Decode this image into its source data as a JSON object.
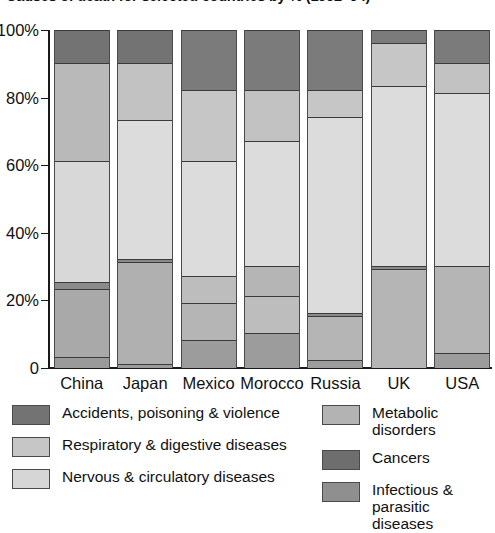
{
  "title": "Causes of death for selected countries by % (1992–94)",
  "axis": {
    "y_ticks": [
      "100%",
      "80%",
      "60%",
      "40%",
      "20%",
      "0"
    ],
    "y_tick_values": [
      100,
      80,
      60,
      40,
      20,
      0
    ]
  },
  "legend": {
    "left": [
      {
        "label": "Accidents, poisoning & violence",
        "color": "#737373"
      },
      {
        "label": "Respiratory & digestive diseases",
        "color": "#c6c6c6"
      },
      {
        "label": "Nervous & circulatory diseases",
        "color": "#d6d6d6"
      }
    ],
    "right": [
      {
        "label": "Metabolic disorders",
        "color": "#b3b3b3"
      },
      {
        "label": "Cancers",
        "color": "#6e6e6e"
      },
      {
        "label": "Infectious & parasitic diseases",
        "color": "#8f8f8f"
      }
    ]
  },
  "chart_data": {
    "type": "bar",
    "subtype": "stacked-100-percent",
    "title": "Causes of death for selected countries by % (1992–94)",
    "xlabel": "",
    "ylabel": "",
    "ylim": [
      0,
      100
    ],
    "grid": false,
    "legend_position": "bottom",
    "categories": [
      "China",
      "Japan",
      "Mexico",
      "Morocco",
      "Russia",
      "UK",
      "USA"
    ],
    "series": [
      {
        "name": "Accidents, poisoning & violence",
        "color": "#737373",
        "values": [
          10,
          10,
          18,
          18,
          18,
          4,
          10
        ]
      },
      {
        "name": "Metabolic disorders",
        "color": "#b3b3b3",
        "values": [
          29,
          17,
          0,
          15,
          8,
          13,
          9
        ]
      },
      {
        "name": "Respiratory & digestive diseases",
        "color": "#c6c6c6",
        "values": [
          0,
          0,
          21,
          0,
          0,
          0,
          0
        ]
      },
      {
        "name": "Nervous & circulatory diseases",
        "color": "#d6d6d6",
        "values": [
          36,
          41,
          34,
          37,
          58,
          53,
          51
        ]
      },
      {
        "name": "Cancers",
        "color": "#6e6e6e",
        "values": [
          2,
          1,
          0,
          0,
          1,
          0,
          0
        ]
      },
      {
        "name": "Infectious & parasitic diseases",
        "color": "#8f8f8f",
        "values": [
          20,
          30,
          19,
          20,
          14,
          30,
          26
        ]
      },
      {
        "name": "Other (lower band)",
        "color": "#8f8f8f",
        "values": [
          3,
          1,
          8,
          10,
          1,
          0,
          4
        ]
      }
    ],
    "bars": [
      {
        "category": "China",
        "segments": [
          {
            "label": "Accidents, poisoning & violence",
            "value": 10,
            "from": 90,
            "to": 100,
            "color": "#737373"
          },
          {
            "label": "Metabolic disorders",
            "value": 29,
            "from": 61,
            "to": 90,
            "color": "#b9b9b9"
          },
          {
            "label": "Nervous & circulatory diseases",
            "value": 36,
            "from": 25,
            "to": 61,
            "color": "#d8d8d8"
          },
          {
            "label": "Cancers",
            "value": 2,
            "from": 23,
            "to": 25,
            "color": "#8a8a8a"
          },
          {
            "label": "Infectious & parasitic diseases",
            "value": 20,
            "from": 3,
            "to": 23,
            "color": "#a9a9a9"
          },
          {
            "label": "Other",
            "value": 3,
            "from": 0,
            "to": 3,
            "color": "#9a9a9a"
          }
        ]
      },
      {
        "category": "Japan",
        "segments": [
          {
            "label": "Accidents, poisoning & violence",
            "value": 10,
            "from": 90,
            "to": 100,
            "color": "#737373"
          },
          {
            "label": "Metabolic disorders",
            "value": 17,
            "from": 73,
            "to": 90,
            "color": "#c2c2c2"
          },
          {
            "label": "Nervous & circulatory diseases",
            "value": 41,
            "from": 32,
            "to": 73,
            "color": "#dcdcdc"
          },
          {
            "label": "Cancers",
            "value": 1,
            "from": 31,
            "to": 32,
            "color": "#8a8a8a"
          },
          {
            "label": "Infectious & parasitic diseases",
            "value": 30,
            "from": 1,
            "to": 31,
            "color": "#b0b0b0"
          },
          {
            "label": "Other",
            "value": 1,
            "from": 0,
            "to": 1,
            "color": "#9a9a9a"
          }
        ]
      },
      {
        "category": "Mexico",
        "segments": [
          {
            "label": "Accidents, poisoning & violence",
            "value": 18,
            "from": 82,
            "to": 100,
            "color": "#7b7b7b"
          },
          {
            "label": "Respiratory & digestive diseases",
            "value": 21,
            "from": 61,
            "to": 82,
            "color": "#c6c6c6"
          },
          {
            "label": "Nervous & circulatory diseases",
            "value": 34,
            "from": 27,
            "to": 61,
            "color": "#dcdcdc"
          },
          {
            "label": "Metabolic disorders",
            "value": 8,
            "from": 19,
            "to": 27,
            "color": "#bdbdbd"
          },
          {
            "label": "Infectious & parasitic diseases",
            "value": 11,
            "from": 8,
            "to": 19,
            "color": "#b5b5b5"
          },
          {
            "label": "Other",
            "value": 8,
            "from": 0,
            "to": 8,
            "color": "#9c9c9c"
          }
        ]
      },
      {
        "category": "Morocco",
        "segments": [
          {
            "label": "Accidents, poisoning & violence",
            "value": 18,
            "from": 82,
            "to": 100,
            "color": "#7b7b7b"
          },
          {
            "label": "Metabolic disorders",
            "value": 15,
            "from": 67,
            "to": 82,
            "color": "#c2c2c2"
          },
          {
            "label": "Nervous & circulatory diseases",
            "value": 37,
            "from": 30,
            "to": 67,
            "color": "#dcdcdc"
          },
          {
            "label": "Infectious & parasitic diseases",
            "value": 9,
            "from": 21,
            "to": 30,
            "color": "#b5b5b5"
          },
          {
            "label": "Respiratory & digestive diseases",
            "value": 11,
            "from": 10,
            "to": 21,
            "color": "#bdbdbd"
          },
          {
            "label": "Other",
            "value": 10,
            "from": 0,
            "to": 10,
            "color": "#9c9c9c"
          }
        ]
      },
      {
        "category": "Russia",
        "segments": [
          {
            "label": "Accidents, poisoning & violence",
            "value": 18,
            "from": 82,
            "to": 100,
            "color": "#7b7b7b"
          },
          {
            "label": "Metabolic disorders",
            "value": 8,
            "from": 74,
            "to": 82,
            "color": "#c6c6c6"
          },
          {
            "label": "Nervous & circulatory diseases",
            "value": 58,
            "from": 16,
            "to": 74,
            "color": "#dcdcdc"
          },
          {
            "label": "Cancers",
            "value": 1,
            "from": 15,
            "to": 16,
            "color": "#8a8a8a"
          },
          {
            "label": "Infectious & parasitic diseases",
            "value": 13,
            "from": 2,
            "to": 15,
            "color": "#b5b5b5"
          },
          {
            "label": "Other",
            "value": 2,
            "from": 0,
            "to": 2,
            "color": "#9c9c9c"
          }
        ]
      },
      {
        "category": "UK",
        "segments": [
          {
            "label": "Accidents, poisoning & violence",
            "value": 4,
            "from": 96,
            "to": 100,
            "color": "#7b7b7b"
          },
          {
            "label": "Metabolic disorders",
            "value": 13,
            "from": 83,
            "to": 96,
            "color": "#c6c6c6"
          },
          {
            "label": "Nervous & circulatory diseases",
            "value": 53,
            "from": 30,
            "to": 83,
            "color": "#dcdcdc"
          },
          {
            "label": "Cancers",
            "value": 1,
            "from": 29,
            "to": 30,
            "color": "#8a8a8a"
          },
          {
            "label": "Infectious & parasitic diseases",
            "value": 29,
            "from": 0,
            "to": 29,
            "color": "#b5b5b5"
          }
        ]
      },
      {
        "category": "USA",
        "segments": [
          {
            "label": "Accidents, poisoning & violence",
            "value": 10,
            "from": 90,
            "to": 100,
            "color": "#7b7b7b"
          },
          {
            "label": "Metabolic disorders",
            "value": 9,
            "from": 81,
            "to": 90,
            "color": "#c2c2c2"
          },
          {
            "label": "Nervous & circulatory diseases",
            "value": 51,
            "from": 30,
            "to": 81,
            "color": "#dcdcdc"
          },
          {
            "label": "Infectious & parasitic diseases",
            "value": 26,
            "from": 4,
            "to": 30,
            "color": "#b5b5b5"
          },
          {
            "label": "Other",
            "value": 4,
            "from": 0,
            "to": 4,
            "color": "#9c9c9c"
          }
        ]
      }
    ]
  }
}
